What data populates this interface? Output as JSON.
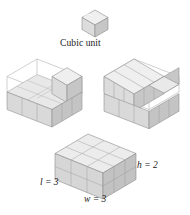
{
  "figure": {
    "kind": "geometry-illustration",
    "topic": "volume-of-rectangular-prism-by-unit-cubes",
    "caption": "Cubic unit",
    "labels": {
      "length": "l = 3",
      "width": "w = 3",
      "height": "h = 2"
    }
  },
  "colors": {
    "top_face": "#efefef",
    "front_face": "#d8d8d8",
    "side_face": "#c4c4c4",
    "interior_floor": "#e6e6e6",
    "outline": "#8a8a8a",
    "wire_outline": "#a8a8a8",
    "text": "#1b1b1b",
    "background": "#ffffff"
  },
  "panels": [
    {
      "name": "cubic-unit",
      "description": "single unit cube",
      "cube_count": 1,
      "dimensions": {
        "l": 1,
        "w": 1,
        "h": 1
      }
    },
    {
      "name": "partially-filled-box-left",
      "description": "3 by 3 by 2 box with bottom layer filled and one cube on second layer",
      "dimensions": {
        "l": 3,
        "w": 3,
        "h": 2
      },
      "cubes_placed": 10,
      "capacity": 18
    },
    {
      "name": "partially-filled-box-right",
      "description": "3 by 3 by 2 box with bottom layer filled and six cubes on second layer",
      "dimensions": {
        "l": 3,
        "w": 3,
        "h": 2
      },
      "cubes_placed": 15,
      "capacity": 18
    },
    {
      "name": "completed-solid",
      "description": "fully filled 3 by 3 by 2 rectangular prism with dimension labels",
      "dimensions": {
        "l": 3,
        "w": 3,
        "h": 2
      },
      "cubes_placed": 18,
      "capacity": 18
    }
  ]
}
